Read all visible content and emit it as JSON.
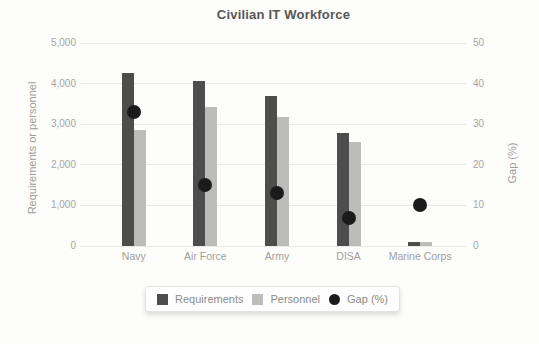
{
  "chart_data": {
    "type": "bar",
    "title": "Civilian IT Workforce",
    "categories": [
      "Navy",
      "Air Force",
      "Army",
      "DISA",
      "Marine Corps"
    ],
    "series": [
      {
        "name": "Requirements",
        "type": "bar",
        "axis": "left",
        "color": "#4d4d4d",
        "values": [
          4270,
          4060,
          3690,
          2780,
          100
        ]
      },
      {
        "name": "Personnel",
        "type": "bar",
        "axis": "left",
        "color": "#bcbcba",
        "values": [
          2850,
          3430,
          3180,
          2570,
          90
        ]
      },
      {
        "name": "Gap (%)",
        "type": "scatter",
        "axis": "right",
        "color": "#1b1b1b",
        "values": [
          33,
          15,
          13,
          7,
          10
        ]
      }
    ],
    "y_left": {
      "label": "Requirements or personnel",
      "min": 0,
      "max": 5000,
      "ticks": [
        0,
        1000,
        2000,
        3000,
        4000,
        5000
      ],
      "tick_labels": [
        "0",
        "1,000",
        "2,000",
        "3,000",
        "4,000",
        "5,000"
      ]
    },
    "y_right": {
      "label": "Gap (%)",
      "min": 0,
      "max": 50,
      "ticks": [
        0,
        10,
        20,
        30,
        40,
        50
      ],
      "tick_labels": [
        "0",
        "10",
        "20",
        "30",
        "40",
        "50"
      ]
    },
    "grid": true,
    "legend_position": "bottom"
  }
}
